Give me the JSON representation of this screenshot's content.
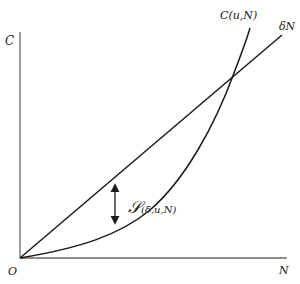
{
  "diagram": {
    "axes": {
      "y_label": "C",
      "x_label": "N",
      "origin_label": "O"
    },
    "curves": {
      "line_label": "δN",
      "curve_label": "C(u,N)",
      "gap_label_symbol": "𝒮",
      "gap_label_args": "(δ,u,N)"
    },
    "colors": {
      "axis": "#6a6a6a",
      "curve": "#1a1a1a",
      "background": "#ffffff"
    }
  }
}
